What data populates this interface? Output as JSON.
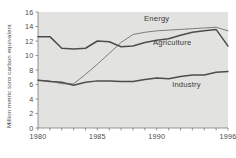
{
  "chart_data": {
    "type": "line",
    "title": "",
    "xlabel": "",
    "ylabel": "Million metric tons carbon equivalent",
    "xlim": [
      1980,
      1996
    ],
    "ylim": [
      0,
      16
    ],
    "ytick_values": [
      0,
      2,
      4,
      6,
      8,
      10,
      12,
      14,
      16
    ],
    "ytick_labels": [
      "0",
      "2",
      "4",
      "6",
      "8",
      "10",
      "12",
      "14",
      "16"
    ],
    "xtick_values": [
      1980,
      1981,
      1982,
      1983,
      1984,
      1985,
      1986,
      1987,
      1988,
      1989,
      1990,
      1991,
      1992,
      1993,
      1994,
      1995,
      1996
    ],
    "xtick_labels_shown": [
      "1980",
      "1985",
      "1990",
      "1996"
    ],
    "xtick_labeled_values": [
      1980,
      1985,
      1990,
      1996
    ],
    "grid": false,
    "legend_position": "inline-annotations",
    "plot_background": "#e2e2e0",
    "x": [
      1980,
      1981,
      1982,
      1983,
      1984,
      1985,
      1986,
      1987,
      1988,
      1989,
      1990,
      1991,
      1992,
      1993,
      1994,
      1995,
      1996
    ],
    "series": [
      {
        "name": "Energy",
        "label": "Energy",
        "color": "#7d7d7d",
        "values": [
          6.6,
          6.5,
          6.1,
          6.1,
          7.4,
          8.8,
          10.3,
          11.8,
          12.9,
          13.2,
          13.4,
          13.5,
          13.6,
          13.7,
          13.8,
          13.9,
          13.4
        ]
      },
      {
        "name": "Agriculture",
        "label": "Agriculture",
        "color": "#4d4d4d",
        "values": [
          12.6,
          12.6,
          11.0,
          10.9,
          11.0,
          12.0,
          11.9,
          11.2,
          11.3,
          11.8,
          12.1,
          12.3,
          12.8,
          13.2,
          13.4,
          13.6,
          11.3
        ]
      },
      {
        "name": "Industry",
        "label": "Industry",
        "color": "#4d4d4d",
        "values": [
          6.6,
          6.4,
          6.3,
          5.9,
          6.3,
          6.5,
          6.5,
          6.4,
          6.4,
          6.7,
          6.9,
          6.8,
          7.1,
          7.3,
          7.3,
          7.7,
          7.8
        ]
      }
    ],
    "annotations": [
      {
        "text": "Energy",
        "x": 1990.0,
        "y": 14.7
      },
      {
        "text": "Agriculture",
        "x": 1991.3,
        "y": 11.4
      },
      {
        "text": "Industry",
        "x": 1992.5,
        "y": 5.6
      }
    ]
  }
}
